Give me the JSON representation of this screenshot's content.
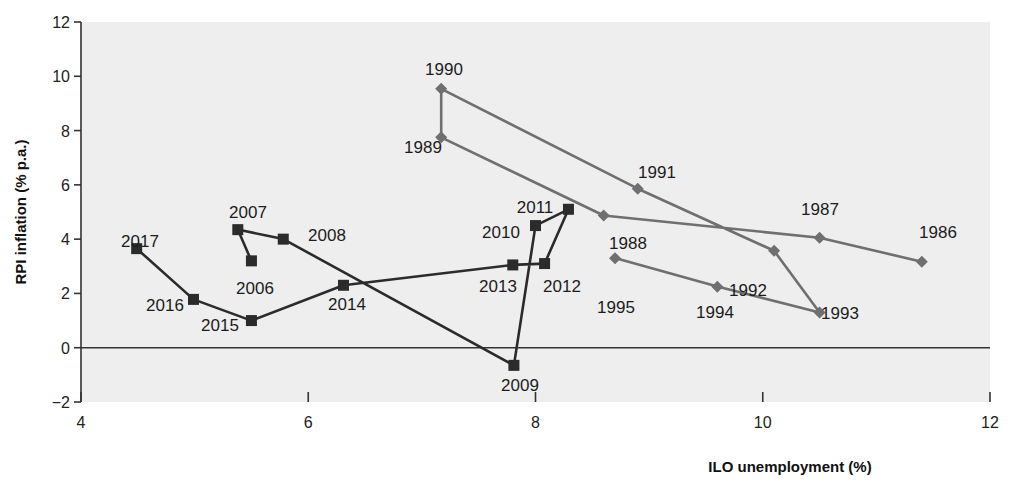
{
  "chart_data": {
    "type": "scatter",
    "title": "",
    "xlabel": "ILO unemployment (%)",
    "ylabel": "RPI inflation (% p.a.)",
    "xlim": [
      4,
      12
    ],
    "ylim": [
      -2,
      12
    ],
    "xticks": [
      "4",
      "6",
      "8",
      "10",
      "12"
    ],
    "yticks": [
      "12",
      "10",
      "8",
      "6",
      "4",
      "2",
      "0",
      "-2"
    ],
    "grid": false,
    "legend": "none",
    "zero_line": 0,
    "series": [
      {
        "name": "1986-1995",
        "marker": "diamond",
        "color": "#6f6f6f",
        "points": [
          {
            "label": "1986",
            "x": 11.4,
            "y": 3.17,
            "lx": 938,
            "ly": 238
          },
          {
            "label": "1987",
            "x": 10.5,
            "y": 4.05,
            "lx": 820,
            "ly": 215
          },
          {
            "label": "1988",
            "x": 8.6,
            "y": 4.87,
            "lx": 628,
            "ly": 249
          },
          {
            "label": "1989",
            "x": 7.17,
            "y": 7.75,
            "lx": 423,
            "ly": 153
          },
          {
            "label": "1990",
            "x": 7.17,
            "y": 9.54,
            "lx": 444,
            "ly": 75
          },
          {
            "label": "1991",
            "x": 8.9,
            "y": 5.86,
            "lx": 657,
            "ly": 178
          },
          {
            "label": "1992",
            "x": 10.1,
            "y": 3.57,
            "lx": 748,
            "ly": 296
          },
          {
            "label": "1993",
            "x": 10.5,
            "y": 1.3,
            "lx": 840,
            "ly": 319
          },
          {
            "label": "1994",
            "x": 9.6,
            "y": 2.25,
            "lx": 715,
            "ly": 318
          },
          {
            "label": "1995",
            "x": 8.7,
            "y": 3.3,
            "lx": 616,
            "ly": 313
          }
        ]
      },
      {
        "name": "2006-2017",
        "marker": "square",
        "color": "#2b2b2b",
        "points": [
          {
            "label": "2006",
            "x": 5.5,
            "y": 3.2,
            "lx": 255,
            "ly": 294
          },
          {
            "label": "2007",
            "x": 5.38,
            "y": 4.35,
            "lx": 248,
            "ly": 218
          },
          {
            "label": "2008",
            "x": 5.78,
            "y": 4.0,
            "lx": 327,
            "ly": 241
          },
          {
            "label": "2009",
            "x": 7.81,
            "y": -0.65,
            "lx": 520,
            "ly": 391
          },
          {
            "label": "2010",
            "x": 8.0,
            "y": 4.5,
            "lx": 501,
            "ly": 238
          },
          {
            "label": "2011",
            "x": 8.29,
            "y": 5.1,
            "lx": 535,
            "ly": 213
          },
          {
            "label": "2012",
            "x": 8.08,
            "y": 3.1,
            "lx": 562,
            "ly": 292
          },
          {
            "label": "2013",
            "x": 7.8,
            "y": 3.05,
            "lx": 498,
            "ly": 292
          },
          {
            "label": "2014",
            "x": 6.31,
            "y": 2.3,
            "lx": 347,
            "ly": 310
          },
          {
            "label": "2015",
            "x": 5.5,
            "y": 1.0,
            "lx": 220,
            "ly": 331
          },
          {
            "label": "2016",
            "x": 4.99,
            "y": 1.78,
            "lx": 165,
            "ly": 311
          },
          {
            "label": "2017",
            "x": 4.49,
            "y": 3.65,
            "lx": 140,
            "ly": 247
          }
        ]
      }
    ]
  },
  "colors": {
    "plot_background": "#eeeeee",
    "axis": "#333333",
    "series_old": "#6f6f6f",
    "series_new": "#2b2b2b"
  }
}
